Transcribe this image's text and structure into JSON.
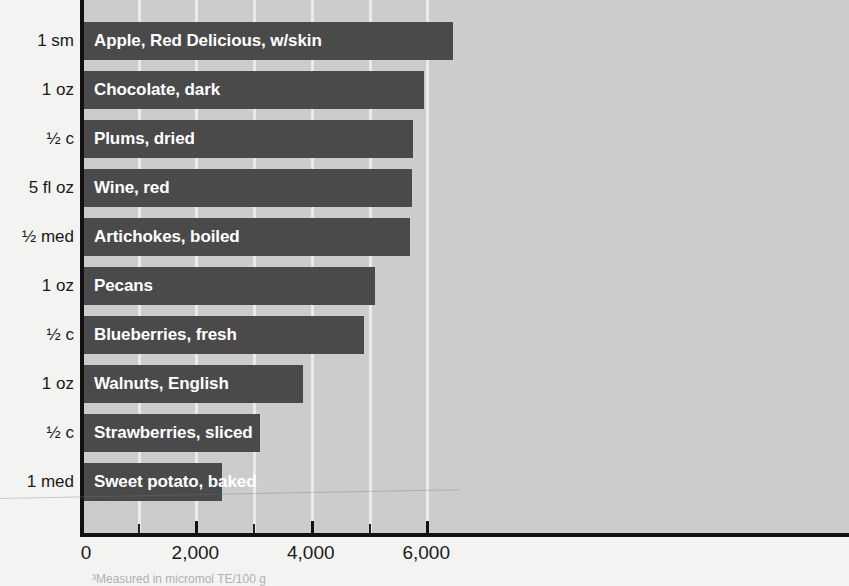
{
  "chart_data": {
    "type": "bar",
    "orientation": "horizontal",
    "title": "",
    "xlabel": "",
    "ylabel": "",
    "xlim": [
      0,
      6650
    ],
    "xticks": [
      0,
      2000,
      4000,
      6000
    ],
    "xtick_labels": [
      "0",
      "2,000",
      "4,000",
      "6,000"
    ],
    "minor_tick_interval": 1000,
    "grid": "vertical-white-gridlines",
    "legend": "none",
    "categories": [
      "Apple, Red Delicious, w/skin",
      "Chocolate, dark",
      "Plums, dried",
      "Wine, red",
      "Artichokes, boiled",
      "Pecans",
      "Blueberries, fresh",
      "Walnuts, English",
      "Strawberries, sliced",
      "Sweet potato, baked"
    ],
    "serving_sizes": [
      "1 sm",
      "1 oz",
      "½ c",
      "5 fl oz",
      "½ med",
      "1 oz",
      "½ c",
      "1 oz",
      "½ c",
      "1 med"
    ],
    "values": [
      6400,
      5900,
      5700,
      5690,
      5650,
      5050,
      4850,
      3800,
      3050,
      2400
    ],
    "bar_color": "#4a4a4a",
    "plot_background": "#cccccc",
    "gridline_color": "#efefef",
    "axis_color": "#111111",
    "label_color": "#1a1a1a",
    "bar_label_color": "#ffffff"
  },
  "footnote": {
    "text": "³Measured in micromol TE/100 g"
  }
}
